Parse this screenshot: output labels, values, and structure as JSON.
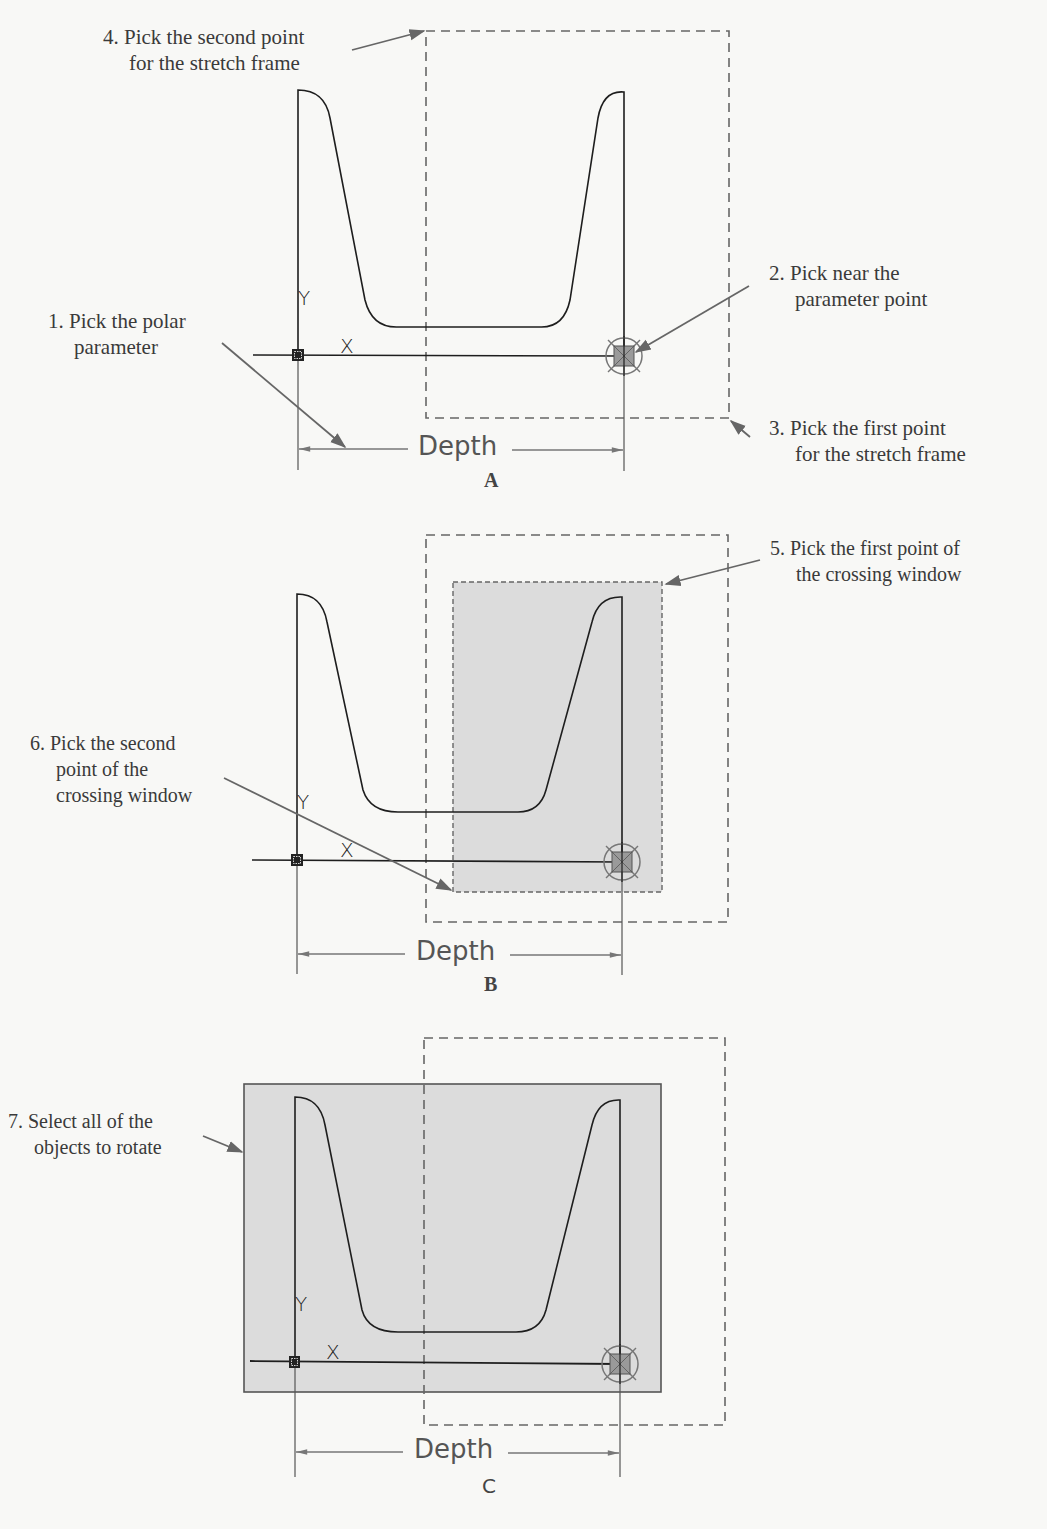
{
  "figure": {
    "panels": [
      {
        "id": "A",
        "caption": "A",
        "dimension_label": "Depth",
        "axis_x": "X",
        "axis_y": "Y",
        "callouts": [
          {
            "number": "4.",
            "lines": [
              "Pick the second point",
              "for the stretch frame"
            ]
          },
          {
            "number": "2.",
            "lines": [
              "Pick near the",
              "parameter point"
            ]
          },
          {
            "number": "1.",
            "lines": [
              "Pick the polar",
              "parameter"
            ]
          },
          {
            "number": "3.",
            "lines": [
              "Pick the first point",
              "for the stretch frame"
            ]
          }
        ]
      },
      {
        "id": "B",
        "caption": "B",
        "dimension_label": "Depth",
        "axis_x": "X",
        "axis_y": "Y",
        "callouts": [
          {
            "number": "5.",
            "lines": [
              "Pick the first point of",
              "the crossing window"
            ]
          },
          {
            "number": "6.",
            "lines": [
              "Pick the second",
              "point of the",
              "crossing window"
            ]
          }
        ]
      },
      {
        "id": "C",
        "caption": "C",
        "dimension_label": "Depth",
        "axis_x": "X",
        "axis_y": "Y",
        "callouts": [
          {
            "number": "7.",
            "lines": [
              "Select all of the",
              "objects to rotate"
            ]
          }
        ]
      }
    ],
    "colors": {
      "background": "#f8f8f6",
      "outline": "#1e1e1e",
      "leader": "#666666",
      "dashed_frame": "#666666",
      "selection_fill": "#dcdcdc",
      "grip_fill": "#9a9a9a"
    }
  }
}
